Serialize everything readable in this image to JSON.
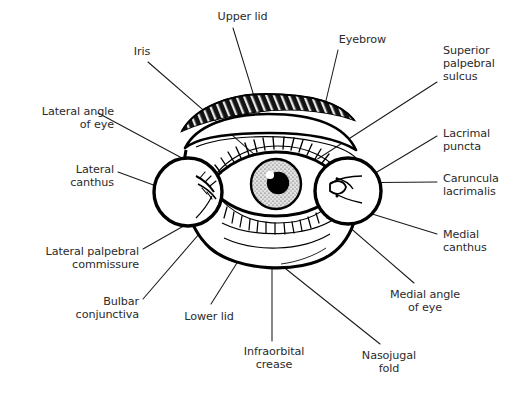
{
  "figure": {
    "kind": "anatomical-line-diagram",
    "style": "black ink line drawing on white background, two circular magnified insets at the lateral and medial canthi",
    "colors": {
      "background": "#ffffff",
      "ink": "#000000",
      "label_text": "#2b2b2b",
      "leader_line": "#1a1a1a",
      "iris_fill": "#d9d9d9",
      "pupil_fill": "#000000",
      "highlight_fill": "#ffffff",
      "eyebrow_fill": "#151515"
    }
  },
  "labels": [
    {
      "id": "upper-lid",
      "text": "Upper lid",
      "align": "center",
      "x": 190,
      "y": 10,
      "w": 105
    },
    {
      "id": "iris",
      "text": "Iris",
      "align": "center",
      "x": 112,
      "y": 45,
      "w": 60
    },
    {
      "id": "eyebrow",
      "text": "Eyebrow",
      "align": "center",
      "x": 325,
      "y": 33,
      "w": 75
    },
    {
      "id": "superior-palpebral-sulcus",
      "text": "Superior\npalpebral\nsulcus",
      "align": "left",
      "x": 443,
      "y": 44,
      "w": 72
    },
    {
      "id": "lateral-angle-of-eye",
      "text": "Lateral angle\nof eye",
      "align": "right",
      "x": 6,
      "y": 105,
      "w": 108
    },
    {
      "id": "lacrimal-puncta",
      "text": "Lacrimal\npuncta",
      "align": "left",
      "x": 443,
      "y": 127,
      "w": 72
    },
    {
      "id": "lateral-canthus",
      "text": "Lateral\ncanthus",
      "align": "right",
      "x": 30,
      "y": 163,
      "w": 84
    },
    {
      "id": "caruncula-lacrimalis",
      "text": "Caruncula\nlacrimalis",
      "align": "left",
      "x": 443,
      "y": 172,
      "w": 72
    },
    {
      "id": "medial-canthus",
      "text": "Medial\ncanthus",
      "align": "left",
      "x": 443,
      "y": 228,
      "w": 72
    },
    {
      "id": "lateral-palpebral-commissure",
      "text": "Lateral palpebral\ncommissure",
      "align": "right",
      "x": 2,
      "y": 245,
      "w": 137
    },
    {
      "id": "bulbar-conjunctiva",
      "text": "Bulbar\nconjunctiva",
      "align": "right",
      "x": 58,
      "y": 295,
      "w": 81
    },
    {
      "id": "medial-angle-of-eye",
      "text": "Medial angle\nof eye",
      "align": "center",
      "x": 373,
      "y": 288,
      "w": 104
    },
    {
      "id": "lower-lid",
      "text": "Lower lid",
      "align": "center",
      "x": 168,
      "y": 310,
      "w": 82
    },
    {
      "id": "infraorbital-crease",
      "text": "Infraorbital\ncrease",
      "align": "center",
      "x": 225,
      "y": 345,
      "w": 98
    },
    {
      "id": "nasojugal-fold",
      "text": "Nasojugal\nfold",
      "align": "center",
      "x": 345,
      "y": 349,
      "w": 88
    }
  ],
  "leader_lines": [
    {
      "id": "leader-upper-lid",
      "from": [
        233,
        28
      ],
      "to": [
        265,
        132
      ]
    },
    {
      "id": "leader-iris",
      "from": [
        148,
        62
      ],
      "to": [
        263,
        162
      ]
    },
    {
      "id": "leader-eyebrow",
      "from": [
        338,
        50
      ],
      "to": [
        324,
        109
      ]
    },
    {
      "id": "leader-superior-palpebral-sulcus",
      "from": [
        437,
        82
      ],
      "to": [
        316,
        160
      ]
    },
    {
      "id": "leader-lateral-angle-of-eye",
      "from": [
        98,
        113
      ],
      "to": [
        193,
        164
      ]
    },
    {
      "id": "leader-lacrimal-puncta",
      "from": [
        437,
        136
      ],
      "to": [
        367,
        178
      ]
    },
    {
      "id": "leader-lateral-canthus",
      "from": [
        118,
        172
      ],
      "to": [
        178,
        194
      ]
    },
    {
      "id": "leader-caruncula-lacrimalis",
      "from": [
        437,
        182
      ],
      "to": [
        323,
        182
      ]
    },
    {
      "id": "leader-medial-canthus",
      "from": [
        437,
        234
      ],
      "to": [
        356,
        209
      ]
    },
    {
      "id": "leader-lateral-palpebral-commissure",
      "from": [
        143,
        249
      ],
      "to": [
        196,
        219
      ]
    },
    {
      "id": "leader-bulbar-conjunctiva",
      "from": [
        143,
        299
      ],
      "to": [
        237,
        190
      ]
    },
    {
      "id": "leader-medial-angle-of-eye",
      "from": [
        414,
        283
      ],
      "to": [
        333,
        213
      ]
    },
    {
      "id": "leader-lower-lid",
      "from": [
        211,
        304
      ],
      "to": [
        261,
        225
      ]
    },
    {
      "id": "leader-infraorbital-crease",
      "from": [
        272,
        341
      ],
      "to": [
        272,
        255
      ]
    },
    {
      "id": "leader-nasojugal-fold",
      "from": [
        380,
        344
      ],
      "to": [
        281,
        265
      ]
    }
  ]
}
